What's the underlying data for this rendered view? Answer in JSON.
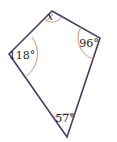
{
  "figure": {
    "type": "quadrilateral",
    "colors": {
      "edge": "#4a3b6b",
      "arc": "#c87a4a",
      "text": "#231f20"
    },
    "vertices": {
      "top": [
        52,
        11
      ],
      "right": [
        100,
        38
      ],
      "bottom": [
        67,
        137
      ],
      "left": [
        9,
        54
      ]
    },
    "angles": [
      {
        "vertex": "top",
        "label": "x"
      },
      {
        "vertex": "right",
        "label": "96°"
      },
      {
        "vertex": "bottom",
        "label": "57°"
      },
      {
        "vertex": "left",
        "label": "118°"
      }
    ]
  }
}
